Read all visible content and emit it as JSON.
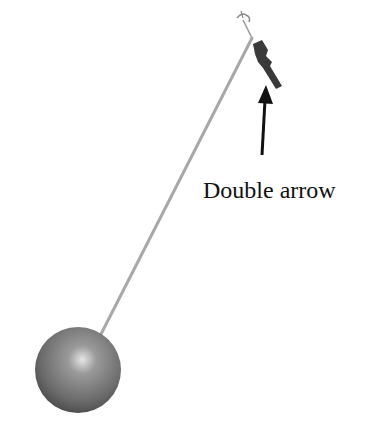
{
  "diagram": {
    "label": "Double arrow",
    "colors": {
      "background": "#ffffff",
      "rod": "#a8a8a8",
      "bob_light": "#cfcfcf",
      "bob_dark": "#4a4a4a",
      "arrow": "#111111",
      "double_arrow": "#3a3a3a"
    }
  }
}
